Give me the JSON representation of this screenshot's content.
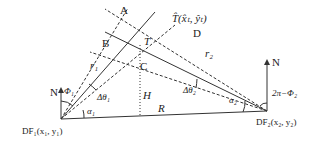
{
  "diagram": {
    "colors": {
      "line": "#333333",
      "background": "#ffffff"
    },
    "stations": {
      "df1": {
        "label": "DF₁(x₁, y₁)",
        "north": "N",
        "bearing_angle": "Φ₁",
        "alpha": "α₁",
        "delta_theta": "Δθ₁",
        "range": "r₁"
      },
      "df2": {
        "label": "DF₂(x₂, y₂)",
        "north": "N",
        "bearing_angle": "2π−Φ₂",
        "alpha": "α₂",
        "delta_theta": "Δθ₂",
        "range": "r₂"
      }
    },
    "points": {
      "A": "A",
      "B": "B",
      "C": "C",
      "D": "D",
      "T": "T",
      "T_hat": "T̂(x̂ₜ, ŷₜ)"
    },
    "baseline": "R",
    "height": "H"
  }
}
